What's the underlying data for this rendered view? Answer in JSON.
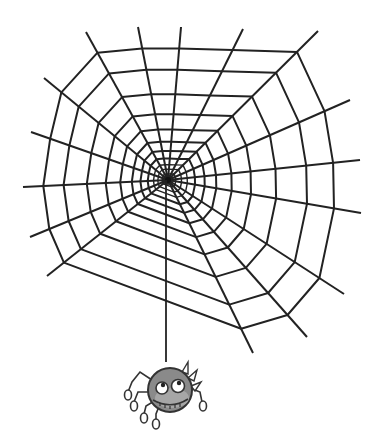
{
  "image": {
    "subject": "Cartoon spider web with a spider hanging from a thread",
    "background_color": "#ffffff",
    "line_color": "#222222",
    "spider_body_color": "#8a8a8a",
    "spider_face_color": "#a6a6a6"
  },
  "web": {
    "center": [
      168,
      180
    ],
    "spokes": [
      [
        86,
        32
      ],
      [
        138,
        27
      ],
      [
        181,
        27
      ],
      [
        243,
        29
      ],
      [
        318,
        31
      ],
      [
        350,
        100
      ],
      [
        360,
        160
      ],
      [
        361,
        213
      ],
      [
        344,
        294
      ],
      [
        307,
        337
      ],
      [
        253,
        353
      ],
      [
        47,
        276
      ],
      [
        30,
        237
      ],
      [
        23,
        187
      ],
      [
        31,
        132
      ],
      [
        44,
        78
      ]
    ]
  },
  "spider": {
    "thread_end": [
      166,
      362
    ],
    "body_center": [
      170,
      390
    ],
    "body_radius": 22
  }
}
